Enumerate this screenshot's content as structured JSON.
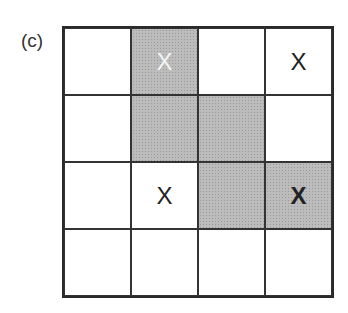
{
  "panel_label": "(c)",
  "grid": {
    "rows": 4,
    "cols": 4,
    "colors": {
      "shaded": "#bcbcbc",
      "empty": "#ffffff",
      "line": "#2a2a2a"
    },
    "cells": [
      [
        {
          "shaded": false,
          "mark": ""
        },
        {
          "shaded": true,
          "mark": "X",
          "mark_color": "white"
        },
        {
          "shaded": false,
          "mark": ""
        },
        {
          "shaded": false,
          "mark": "X"
        }
      ],
      [
        {
          "shaded": false,
          "mark": ""
        },
        {
          "shaded": true,
          "mark": ""
        },
        {
          "shaded": true,
          "mark": ""
        },
        {
          "shaded": false,
          "mark": ""
        }
      ],
      [
        {
          "shaded": false,
          "mark": ""
        },
        {
          "shaded": false,
          "mark": "X"
        },
        {
          "shaded": true,
          "mark": ""
        },
        {
          "shaded": true,
          "mark": "X",
          "mark_weight": "bold"
        }
      ],
      [
        {
          "shaded": false,
          "mark": ""
        },
        {
          "shaded": false,
          "mark": ""
        },
        {
          "shaded": false,
          "mark": ""
        },
        {
          "shaded": false,
          "mark": ""
        }
      ]
    ]
  }
}
